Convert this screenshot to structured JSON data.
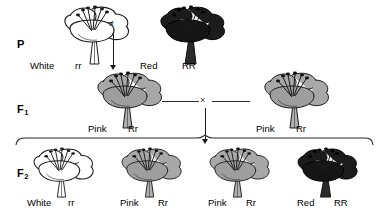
{
  "diagram": {
    "type": "genetics-cross-diagram",
    "colors": {
      "white_petal": "#ffffff",
      "pink_petal": "#a8a8a8",
      "red_petal": "#1c1c1c",
      "outline": "#1a1a1a",
      "stem_white": "#ffffff",
      "stem_pink": "#b0b0b0",
      "stem_red": "#2a2a2a"
    },
    "generations": [
      {
        "id": "P",
        "label": "P",
        "subscript": ""
      },
      {
        "id": "F1",
        "label": "F",
        "subscript": "1"
      },
      {
        "id": "F2",
        "label": "F",
        "subscript": "2"
      }
    ],
    "cross_symbol": "×",
    "rows": {
      "p": {
        "name": "parental-generation",
        "organisms": [
          {
            "phenotype": "White",
            "genotype": "rr",
            "color": "white"
          },
          {
            "phenotype": "Red",
            "genotype": "RR",
            "color": "red"
          }
        ],
        "cross_symbol": "×"
      },
      "f1": {
        "name": "f1-generation",
        "organisms": [
          {
            "phenotype": "Pink",
            "genotype": "Rr",
            "color": "pink"
          },
          {
            "phenotype": "Pink",
            "genotype": "Rr",
            "color": "pink"
          }
        ],
        "cross_symbol": "×"
      },
      "f2": {
        "name": "f2-generation",
        "organisms": [
          {
            "phenotype": "White",
            "genotype": "rr",
            "color": "white"
          },
          {
            "phenotype": "Pink",
            "genotype": "Rr",
            "color": "pink"
          },
          {
            "phenotype": "Pink",
            "genotype": "Rr",
            "color": "pink"
          },
          {
            "phenotype": "Red",
            "genotype": "RR",
            "color": "red"
          }
        ]
      }
    }
  }
}
